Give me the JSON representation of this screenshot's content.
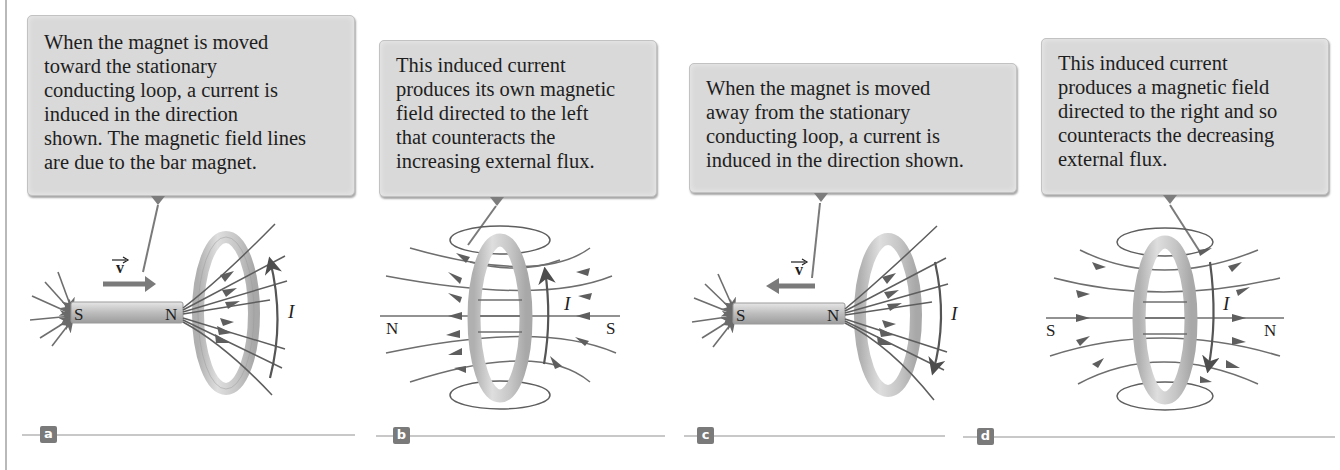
{
  "figure": {
    "panels": [
      {
        "id": "a",
        "badge": "a",
        "callout_lines": [
          "When the magnet is moved",
          "toward the stationary",
          "conducting loop, a current is",
          "induced in the direction",
          "shown. The magnetic field lines",
          "are due to the bar magnet."
        ],
        "magnet_left_pole": "S",
        "magnet_right_pole": "N",
        "velocity_label": "v",
        "velocity_direction": "right",
        "current_label": "I",
        "current_direction": "up"
      },
      {
        "id": "b",
        "badge": "b",
        "callout_lines": [
          "This induced current",
          "produces its own magnetic",
          "field directed to the left",
          "that counteracts the",
          "increasing external flux."
        ],
        "left_pole": "N",
        "right_pole": "S",
        "current_label": "I",
        "field_direction": "left"
      },
      {
        "id": "c",
        "badge": "c",
        "callout_lines": [
          "When the magnet is moved",
          "away from the stationary",
          "conducting loop, a current is",
          "induced in the direction shown."
        ],
        "magnet_left_pole": "S",
        "magnet_right_pole": "N",
        "velocity_label": "v",
        "velocity_direction": "left",
        "current_label": "I",
        "current_direction": "down"
      },
      {
        "id": "d",
        "badge": "d",
        "callout_lines": [
          "This induced current",
          "produces a magnetic field",
          "directed to the right and so",
          "counteracts the decreasing",
          "external flux."
        ],
        "left_pole": "S",
        "right_pole": "N",
        "current_label": "I",
        "field_direction": "right"
      }
    ],
    "colors": {
      "callout_bg": "#d9d9d9",
      "field_line": "#6e6e6e",
      "current_arrow": "#555555",
      "ring": "#c9c9c9",
      "badge_bg": "#7a7a7a"
    }
  }
}
